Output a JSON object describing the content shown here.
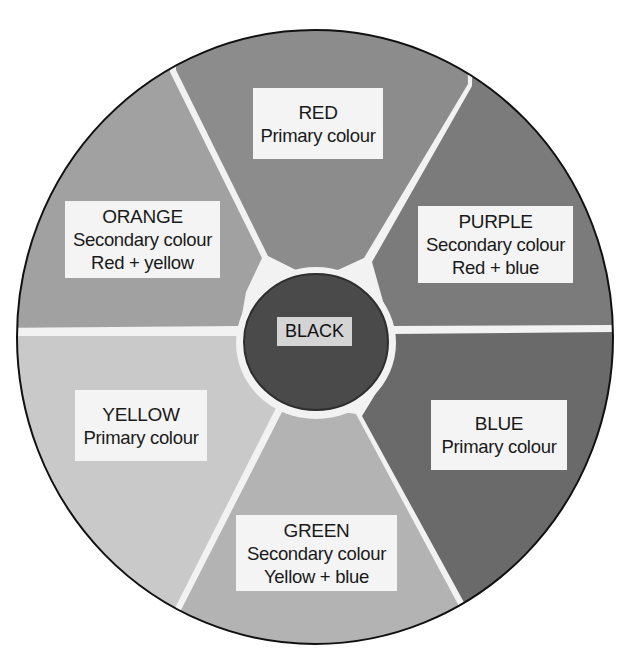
{
  "diagram": {
    "type": "colour-wheel",
    "center": {
      "name": "BLACK",
      "fill": "#4a4a4a"
    },
    "segments": [
      {
        "id": "red",
        "name": "RED",
        "kind": "Primary colour",
        "mix": "",
        "fill": "#8c8c8c"
      },
      {
        "id": "purple",
        "name": "PURPLE",
        "kind": "Secondary colour",
        "mix": "Red + blue",
        "fill": "#7b7b7b"
      },
      {
        "id": "blue",
        "name": "BLUE",
        "kind": "Primary colour",
        "mix": "",
        "fill": "#6a6a6a"
      },
      {
        "id": "green",
        "name": "GREEN",
        "kind": "Secondary colour",
        "mix": "Yellow + blue",
        "fill": "#b3b3b3"
      },
      {
        "id": "yellow",
        "name": "YELLOW",
        "kind": "Primary colour",
        "mix": "",
        "fill": "#c9c9c9"
      },
      {
        "id": "orange",
        "name": "ORANGE",
        "kind": "Secondary colour",
        "mix": "Red + yellow",
        "fill": "#a1a1a1"
      }
    ]
  }
}
